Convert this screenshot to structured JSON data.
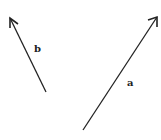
{
  "diagram": {
    "vectors": [
      {
        "id": "a",
        "label": "a",
        "tail": [
          83,
          130
        ],
        "tip": [
          157,
          17
        ],
        "label_pos": [
          127,
          86
        ]
      },
      {
        "id": "b",
        "label": "b",
        "tail": [
          46,
          92
        ],
        "tip": [
          10,
          18
        ],
        "label_pos": [
          34,
          52
        ]
      }
    ],
    "stroke_color": "#222222"
  }
}
